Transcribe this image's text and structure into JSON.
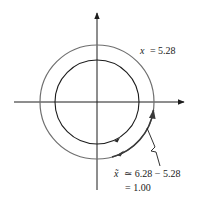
{
  "diagram": {
    "type": "unit-circle-angle-wrap",
    "labels": {
      "angle_label": "x = 5.28",
      "angle_var": "x",
      "angle_eq": "= 5.28",
      "ref_line1_var": "x̃",
      "ref_line1_rest": "≃ 6.28 − 5.28",
      "ref_line2": "= 1.00"
    },
    "colors": {
      "inner_circle": "#1c1c1c",
      "outer_circle": "#6f6f6f",
      "axes": "#1c1c1c",
      "arc_highlight": "#4a4a4a"
    },
    "geometry": {
      "center": [
        97,
        102
      ],
      "inner_radius": 42,
      "outer_radius": 57
    }
  }
}
